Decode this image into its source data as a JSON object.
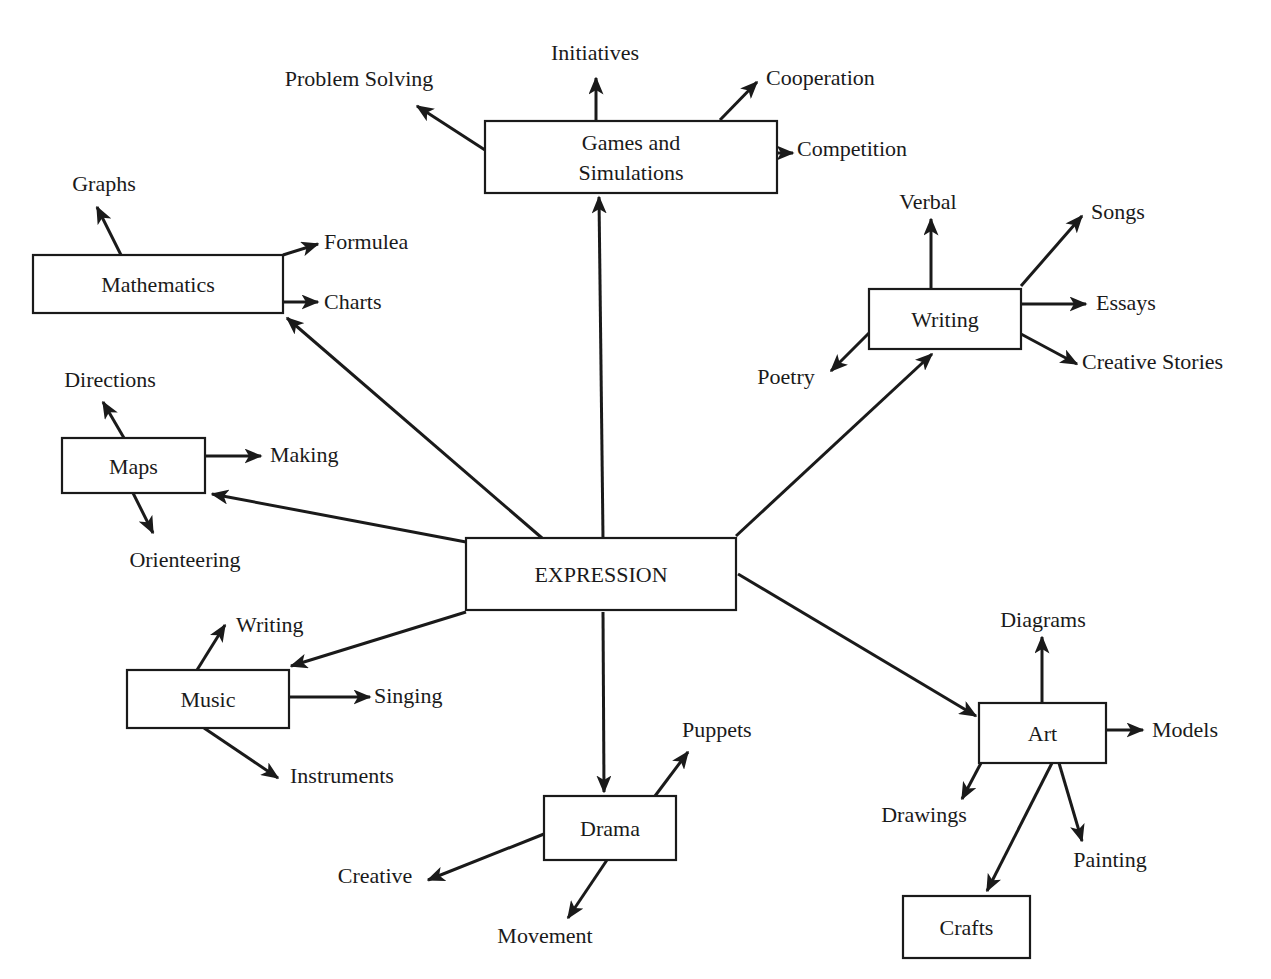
{
  "colors": {
    "ink": "#1a1a1a",
    "background": "#ffffff"
  },
  "center": {
    "label": "EXPRESSION",
    "x": 466,
    "y": 538,
    "w": 270,
    "h": 72
  },
  "nodes": [
    {
      "id": "games",
      "lines": [
        "Games and",
        "Simulations"
      ],
      "x": 485,
      "y": 121,
      "w": 292,
      "h": 72
    },
    {
      "id": "mathematics",
      "lines": [
        "Mathematics"
      ],
      "x": 33,
      "y": 255,
      "w": 250,
      "h": 58
    },
    {
      "id": "maps",
      "lines": [
        "Maps"
      ],
      "x": 62,
      "y": 438,
      "w": 143,
      "h": 55
    },
    {
      "id": "writing",
      "lines": [
        "Writing"
      ],
      "x": 869,
      "y": 289,
      "w": 152,
      "h": 60
    },
    {
      "id": "music",
      "lines": [
        "Music"
      ],
      "x": 127,
      "y": 670,
      "w": 162,
      "h": 58
    },
    {
      "id": "drama",
      "lines": [
        "Drama"
      ],
      "x": 544,
      "y": 796,
      "w": 132,
      "h": 64
    },
    {
      "id": "art",
      "lines": [
        "Art"
      ],
      "x": 979,
      "y": 703,
      "w": 127,
      "h": 60
    },
    {
      "id": "crafts",
      "lines": [
        "Crafts"
      ],
      "x": 903,
      "y": 896,
      "w": 127,
      "h": 62
    }
  ],
  "labels": [
    {
      "text": "Initiatives",
      "x": 595,
      "y": 60,
      "anchor": "middle"
    },
    {
      "text": "Problem Solving",
      "x": 359,
      "y": 86,
      "anchor": "middle"
    },
    {
      "text": "Cooperation",
      "x": 766,
      "y": 85,
      "anchor": "start"
    },
    {
      "text": "Competition",
      "x": 797,
      "y": 156,
      "anchor": "start"
    },
    {
      "text": "Graphs",
      "x": 104,
      "y": 191,
      "anchor": "middle"
    },
    {
      "text": "Formulea",
      "x": 324,
      "y": 249,
      "anchor": "start"
    },
    {
      "text": "Charts",
      "x": 324,
      "y": 309,
      "anchor": "start"
    },
    {
      "text": "Directions",
      "x": 110,
      "y": 387,
      "anchor": "middle"
    },
    {
      "text": "Making",
      "x": 270,
      "y": 462,
      "anchor": "start"
    },
    {
      "text": "Orienteering",
      "x": 185,
      "y": 567,
      "anchor": "middle"
    },
    {
      "text": "Verbal",
      "x": 928,
      "y": 209,
      "anchor": "middle"
    },
    {
      "text": "Songs",
      "x": 1091,
      "y": 219,
      "anchor": "start"
    },
    {
      "text": "Essays",
      "x": 1096,
      "y": 310,
      "anchor": "start"
    },
    {
      "text": "Creative Stories",
      "x": 1082,
      "y": 369,
      "anchor": "start"
    },
    {
      "text": "Poetry",
      "x": 786,
      "y": 384,
      "anchor": "middle"
    },
    {
      "text": "Writing",
      "x": 236,
      "y": 632,
      "anchor": "start"
    },
    {
      "text": "Singing",
      "x": 374,
      "y": 703,
      "anchor": "start"
    },
    {
      "text": "Instruments",
      "x": 290,
      "y": 783,
      "anchor": "start"
    },
    {
      "text": "Puppets",
      "x": 682,
      "y": 737,
      "anchor": "start"
    },
    {
      "text": "Creative",
      "x": 375,
      "y": 883,
      "anchor": "middle"
    },
    {
      "text": "Movement",
      "x": 545,
      "y": 943,
      "anchor": "middle"
    },
    {
      "text": "Diagrams",
      "x": 1043,
      "y": 627,
      "anchor": "middle"
    },
    {
      "text": "Models",
      "x": 1152,
      "y": 737,
      "anchor": "start"
    },
    {
      "text": "Drawings",
      "x": 924,
      "y": 822,
      "anchor": "middle"
    },
    {
      "text": "Painting",
      "x": 1110,
      "y": 867,
      "anchor": "middle"
    }
  ],
  "edges": [
    {
      "from": [
        603,
        538
      ],
      "to": [
        599,
        197
      ]
    },
    {
      "from": [
        542,
        538
      ],
      "to": [
        287,
        318
      ]
    },
    {
      "from": [
        466,
        542
      ],
      "to": [
        212,
        494
      ]
    },
    {
      "from": [
        736,
        536
      ],
      "to": [
        932,
        354
      ]
    },
    {
      "from": [
        466,
        612
      ],
      "to": [
        291,
        666
      ]
    },
    {
      "from": [
        603,
        612
      ],
      "to": [
        604,
        792
      ]
    },
    {
      "from": [
        738,
        574
      ],
      "to": [
        976,
        716
      ]
    },
    {
      "from": [
        596,
        121
      ],
      "to": [
        596,
        78
      ]
    },
    {
      "from": [
        485,
        150
      ],
      "to": [
        417,
        106
      ]
    },
    {
      "from": [
        720,
        120
      ],
      "to": [
        757,
        82
      ]
    },
    {
      "from": [
        777,
        153
      ],
      "to": [
        793,
        153
      ]
    },
    {
      "from": [
        121,
        255
      ],
      "to": [
        97,
        207
      ]
    },
    {
      "from": [
        283,
        255
      ],
      "to": [
        318,
        244
      ]
    },
    {
      "from": [
        283,
        302
      ],
      "to": [
        318,
        302
      ]
    },
    {
      "from": [
        124,
        438
      ],
      "to": [
        103,
        402
      ]
    },
    {
      "from": [
        205,
        456
      ],
      "to": [
        261,
        456
      ]
    },
    {
      "from": [
        133,
        493
      ],
      "to": [
        153,
        533
      ]
    },
    {
      "from": [
        931,
        289
      ],
      "to": [
        931,
        219
      ]
    },
    {
      "from": [
        1021,
        286
      ],
      "to": [
        1082,
        216
      ]
    },
    {
      "from": [
        1021,
        304
      ],
      "to": [
        1086,
        304
      ]
    },
    {
      "from": [
        1021,
        334
      ],
      "to": [
        1077,
        364
      ]
    },
    {
      "from": [
        869,
        333
      ],
      "to": [
        831,
        371
      ]
    },
    {
      "from": [
        197,
        670
      ],
      "to": [
        225,
        625
      ]
    },
    {
      "from": [
        289,
        697
      ],
      "to": [
        370,
        697
      ]
    },
    {
      "from": [
        204,
        728
      ],
      "to": [
        278,
        778
      ]
    },
    {
      "from": [
        655,
        796
      ],
      "to": [
        688,
        752
      ]
    },
    {
      "from": [
        544,
        834
      ],
      "to": [
        428,
        880
      ]
    },
    {
      "from": [
        607,
        860
      ],
      "to": [
        568,
        918
      ]
    },
    {
      "from": [
        1042,
        703
      ],
      "to": [
        1042,
        637
      ]
    },
    {
      "from": [
        1106,
        730
      ],
      "to": [
        1143,
        730
      ]
    },
    {
      "from": [
        981,
        763
      ],
      "to": [
        962,
        799
      ]
    },
    {
      "from": [
        1059,
        763
      ],
      "to": [
        1082,
        841
      ]
    },
    {
      "from": [
        1052,
        763
      ],
      "to": [
        987,
        891
      ]
    }
  ]
}
